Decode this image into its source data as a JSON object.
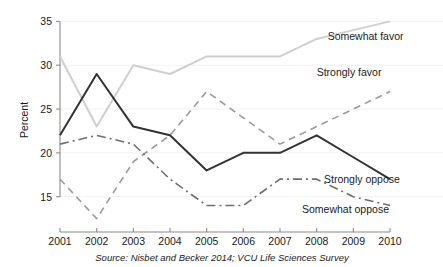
{
  "chart_data": {
    "type": "line",
    "title": "",
    "xlabel": "",
    "ylabel": "Percent",
    "source": "Source: Nisbet and Becker 2014; VCU Life Sciences Survey",
    "x": [
      2001,
      2002,
      2003,
      2004,
      2005,
      2006,
      2007,
      2008,
      2009,
      2010
    ],
    "xticklabels": [
      "2001",
      "2002",
      "2003",
      "2004",
      "2005",
      "2006",
      "2007",
      "2008",
      "2009",
      "2010"
    ],
    "yticks": [
      15,
      20,
      25,
      30,
      35
    ],
    "yticklabels": [
      "15",
      "20",
      "25",
      "30",
      "35"
    ],
    "xlim": [
      2001,
      2010
    ],
    "ylim": [
      12,
      35.5
    ],
    "grid": true,
    "legend_position": "inline-right",
    "series": [
      {
        "name": "Somewhat favor",
        "values": [
          31,
          23,
          30,
          29,
          31,
          31,
          31,
          33,
          34,
          35
        ],
        "color": "#cfcfcf",
        "style": "solid",
        "width": 2.0,
        "label_x": 2008.3,
        "label_y": 32.9,
        "label_anchor": "start"
      },
      {
        "name": "Strongly favor",
        "values": [
          17,
          12.5,
          19,
          22,
          27,
          24,
          21,
          23,
          25,
          27
        ],
        "color": "#9b9b9b",
        "style": "dashed",
        "width": 1.6,
        "label_x": 2008.0,
        "label_y": 28.8,
        "label_anchor": "start"
      },
      {
        "name": "Strongly oppose",
        "values": [
          22,
          29,
          23,
          22,
          18,
          20,
          20,
          22,
          19.5,
          17
        ],
        "color": "#333333",
        "style": "solid",
        "width": 2.0,
        "label_x": 2008.2,
        "label_y": 16.6,
        "label_anchor": "start"
      },
      {
        "name": "Somewhat oppose",
        "values": [
          21,
          22,
          21,
          17,
          14,
          14,
          17,
          17,
          15,
          14
        ],
        "color": "#6e6e6e",
        "style": "dashdot",
        "width": 1.6,
        "label_x": 2007.6,
        "label_y": 13.1,
        "label_anchor": "start"
      }
    ]
  }
}
